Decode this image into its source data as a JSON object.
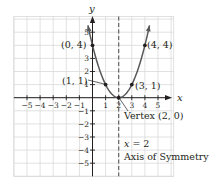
{
  "chart_data": {
    "type": "line",
    "title": "",
    "function": "y = (x - 2)^2",
    "xlabel": "x",
    "ylabel": "y",
    "xlim": [
      -6,
      6.2
    ],
    "ylim": [
      -6,
      6.2
    ],
    "grid": true,
    "x_ticks": [
      -5,
      -4,
      -3,
      -2,
      -1,
      1,
      2,
      3,
      4,
      5
    ],
    "x_tick_labels": [
      "−5",
      "−4",
      "−3",
      "−2",
      "−1",
      "1",
      "2",
      "3",
      "4",
      "5"
    ],
    "y_ticks": [
      5,
      3,
      2,
      1,
      -1,
      -2,
      -3,
      -4,
      -5
    ],
    "y_tick_labels": [
      "5",
      "3",
      "2",
      "1",
      "−1",
      "−2",
      "−3",
      "−4",
      "−5"
    ],
    "series": [
      {
        "name": "parabola",
        "color": "#58585a",
        "x": [
          -0.35,
          0,
          1,
          2,
          3,
          4,
          4.35
        ],
        "y": [
          5.52,
          4,
          1,
          0,
          1,
          4,
          5.52
        ]
      }
    ],
    "points": [
      {
        "x": 0,
        "y": 4,
        "label": "(0, 4)"
      },
      {
        "x": 1,
        "y": 1,
        "label": "(1, 1)"
      },
      {
        "x": 2,
        "y": 0,
        "label": "Vertex (2, 0)"
      },
      {
        "x": 3,
        "y": 1,
        "label": "(3, 1)"
      },
      {
        "x": 4,
        "y": 4,
        "label": "(4, 4)"
      }
    ],
    "annotations": [
      {
        "text": "Vertex (2, 0)",
        "target": [
          2,
          0
        ]
      },
      {
        "text": "x = 2",
        "target": "axis-of-symmetry"
      },
      {
        "text": "Axis of Symmetry",
        "target": "axis-of-symmetry"
      }
    ],
    "axis_of_symmetry": {
      "x": 2,
      "style": "dashed",
      "color": "#58585a"
    }
  },
  "labels": {
    "x_axis": "x",
    "y_axis": "y",
    "p04": "(0, 4)",
    "p11": "(1, 1)",
    "p31": "(3, 1)",
    "p44": "(4, 4)",
    "vertex": "Vertex (2, 0)",
    "aos_eq_var": "x",
    "aos_eq_rest": " = 2",
    "aos_name": "Axis of Symmetry"
  },
  "colors": {
    "grid": "#d9d9d9",
    "axis": "#231f20",
    "curve": "#58585a",
    "text": "#231f20"
  }
}
